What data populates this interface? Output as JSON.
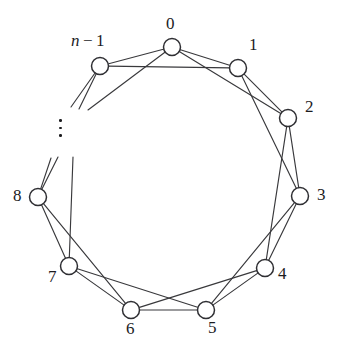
{
  "figure": {
    "type": "graph-diagram",
    "background_color": "#ffffff",
    "edge_color": "#39393c",
    "node_fill_color": "#ffffff",
    "node_stroke_color": "#2f2f33",
    "label_color": "#1c1c1f"
  },
  "ellipsis": {
    "symbol": "vertical-ellipsis",
    "dots": 3,
    "x": 59,
    "y": 119
  },
  "nodes": [
    {
      "id": "0",
      "label": "0",
      "x": 172,
      "y": 47,
      "r": 8.5,
      "label_x": 166,
      "label_y": 15
    },
    {
      "id": "1",
      "label": "1",
      "x": 238,
      "y": 68,
      "r": 8.5,
      "label_x": 249,
      "label_y": 36
    },
    {
      "id": "2",
      "label": "2",
      "x": 288,
      "y": 118,
      "r": 8.5,
      "label_x": 305,
      "label_y": 98
    },
    {
      "id": "3",
      "label": "3",
      "x": 300,
      "y": 196,
      "r": 8.5,
      "label_x": 317,
      "label_y": 186
    },
    {
      "id": "4",
      "label": "4",
      "x": 265,
      "y": 268,
      "r": 8.5,
      "label_x": 278,
      "label_y": 265
    },
    {
      "id": "5",
      "label": "5",
      "x": 206,
      "y": 310,
      "r": 8.5,
      "label_x": 208,
      "label_y": 319
    },
    {
      "id": "6",
      "label": "6",
      "x": 131,
      "y": 310,
      "r": 8.5,
      "label_x": 126,
      "label_y": 320
    },
    {
      "id": "7",
      "label": "7",
      "x": 69,
      "y": 266,
      "r": 8.5,
      "label_x": 48,
      "label_y": 268
    },
    {
      "id": "8",
      "label": "8",
      "x": 38,
      "y": 197,
      "r": 8.5,
      "label_x": 13,
      "label_y": 187
    },
    {
      "id": "n-1",
      "label": "n − 1",
      "x": 100,
      "y": 66,
      "r": 8.5,
      "label_x": 71,
      "label_y": 32
    }
  ],
  "edges": [
    {
      "from": "n-1",
      "to": "0",
      "kind": "ring"
    },
    {
      "from": "0",
      "to": "1",
      "kind": "ring"
    },
    {
      "from": "1",
      "to": "2",
      "kind": "ring"
    },
    {
      "from": "2",
      "to": "3",
      "kind": "ring"
    },
    {
      "from": "3",
      "to": "4",
      "kind": "ring"
    },
    {
      "from": "4",
      "to": "5",
      "kind": "ring"
    },
    {
      "from": "5",
      "to": "6",
      "kind": "ring"
    },
    {
      "from": "6",
      "to": "7",
      "kind": "ring"
    },
    {
      "from": "7",
      "to": "8",
      "kind": "ring"
    },
    {
      "from": "n-1",
      "to": "1",
      "kind": "chord"
    },
    {
      "from": "0",
      "to": "2",
      "kind": "chord"
    },
    {
      "from": "1",
      "to": "3",
      "kind": "chord"
    },
    {
      "from": "2",
      "to": "4",
      "kind": "chord"
    },
    {
      "from": "3",
      "to": "5",
      "kind": "chord"
    },
    {
      "from": "4",
      "to": "6",
      "kind": "chord"
    },
    {
      "from": "5",
      "to": "7",
      "kind": "chord"
    },
    {
      "from": "6",
      "to": "8",
      "kind": "chord"
    }
  ],
  "dangling_edges": [
    {
      "from": "n-1",
      "to_x": 71,
      "to_y": 107,
      "note": "ring continuation toward hidden node"
    },
    {
      "from": "n-1",
      "to_x": 79,
      "to_y": 109,
      "note": "chord continuation toward hidden node"
    },
    {
      "from": "0",
      "to_x": 88,
      "to_y": 110,
      "note": "chord from node 0 toward hidden node"
    },
    {
      "from": "8",
      "to_x": 51,
      "to_y": 158,
      "note": "ring continuation toward hidden node"
    },
    {
      "from": "8",
      "to_x": 58,
      "to_y": 157,
      "note": "chord continuation toward hidden node"
    },
    {
      "from": "7",
      "to_x": 73,
      "to_y": 157,
      "note": "chord from node 7 toward hidden node"
    }
  ]
}
